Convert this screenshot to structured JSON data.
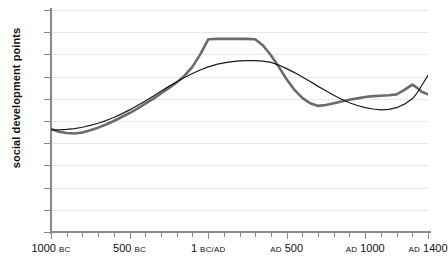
{
  "chart_data": {
    "type": "line",
    "title": "",
    "xlabel": "",
    "ylabel": "social development points",
    "ylim": [
      0,
      50
    ],
    "xlim": [
      -1000,
      1400
    ],
    "grid": true,
    "legend": false,
    "y_ticks": [
      0,
      5,
      10,
      15,
      20,
      25,
      30,
      35,
      40,
      45,
      50
    ],
    "x_major_ticks": [
      {
        "value": -1000,
        "num": "1000",
        "era": "BC"
      },
      {
        "value": -500,
        "num": "500",
        "era": "BC"
      },
      {
        "value": 1,
        "num": "1",
        "era": "BC/AD"
      },
      {
        "value": 500,
        "num": "500",
        "era": "AD",
        "era_first": true
      },
      {
        "value": 1000,
        "num": "1000",
        "era": "AD",
        "era_first": true
      },
      {
        "value": 1400,
        "num": "1400",
        "era": "AD",
        "era_first": true
      }
    ],
    "x_minor_ticks": [
      -900,
      -800,
      -700,
      -600,
      -400,
      -300,
      -200,
      -100,
      100,
      200,
      300,
      400,
      600,
      700,
      800,
      900,
      1100,
      1200,
      1300
    ],
    "series": [
      {
        "name": "thick-gray-series",
        "color": "#6b6b6b",
        "width": 2.6,
        "points": [
          [
            -1000,
            23.2
          ],
          [
            -950,
            22.6
          ],
          [
            -900,
            22.3
          ],
          [
            -850,
            22.2
          ],
          [
            -800,
            22.4
          ],
          [
            -750,
            22.9
          ],
          [
            -700,
            23.5
          ],
          [
            -650,
            24.2
          ],
          [
            -600,
            25.0
          ],
          [
            -550,
            25.9
          ],
          [
            -500,
            26.8
          ],
          [
            -450,
            27.8
          ],
          [
            -400,
            28.9
          ],
          [
            -350,
            30.0
          ],
          [
            -300,
            31.2
          ],
          [
            -250,
            32.4
          ],
          [
            -200,
            33.7
          ],
          [
            -150,
            35.2
          ],
          [
            -100,
            37.2
          ],
          [
            -50,
            40.0
          ],
          [
            1,
            43.4
          ],
          [
            60,
            43.5
          ],
          [
            120,
            43.5
          ],
          [
            180,
            43.5
          ],
          [
            240,
            43.5
          ],
          [
            300,
            43.4
          ],
          [
            350,
            42.0
          ],
          [
            400,
            39.8
          ],
          [
            450,
            37.2
          ],
          [
            500,
            34.4
          ],
          [
            550,
            32.0
          ],
          [
            600,
            30.2
          ],
          [
            650,
            29.0
          ],
          [
            700,
            28.4
          ],
          [
            750,
            28.6
          ],
          [
            800,
            29.0
          ],
          [
            850,
            29.4
          ],
          [
            900,
            29.8
          ],
          [
            950,
            30.1
          ],
          [
            1000,
            30.4
          ],
          [
            1050,
            30.6
          ],
          [
            1100,
            30.7
          ],
          [
            1150,
            30.8
          ],
          [
            1200,
            31.0
          ],
          [
            1250,
            32.0
          ],
          [
            1300,
            33.2
          ],
          [
            1330,
            32.5
          ],
          [
            1360,
            31.6
          ],
          [
            1400,
            31.0
          ]
        ]
      },
      {
        "name": "thin-black-series",
        "color": "#1a1a1a",
        "width": 1.2,
        "points": [
          [
            -1000,
            23.0
          ],
          [
            -950,
            23.0
          ],
          [
            -900,
            23.1
          ],
          [
            -850,
            23.3
          ],
          [
            -800,
            23.6
          ],
          [
            -750,
            24.0
          ],
          [
            -700,
            24.5
          ],
          [
            -650,
            25.1
          ],
          [
            -600,
            25.8
          ],
          [
            -550,
            26.6
          ],
          [
            -500,
            27.5
          ],
          [
            -450,
            28.5
          ],
          [
            -400,
            29.5
          ],
          [
            -350,
            30.6
          ],
          [
            -300,
            31.7
          ],
          [
            -250,
            32.8
          ],
          [
            -200,
            33.8
          ],
          [
            -150,
            34.8
          ],
          [
            -100,
            35.7
          ],
          [
            -50,
            36.5
          ],
          [
            1,
            37.2
          ],
          [
            60,
            37.8
          ],
          [
            120,
            38.2
          ],
          [
            180,
            38.5
          ],
          [
            240,
            38.6
          ],
          [
            300,
            38.6
          ],
          [
            350,
            38.5
          ],
          [
            400,
            38.2
          ],
          [
            450,
            37.6
          ],
          [
            500,
            36.8
          ],
          [
            550,
            35.9
          ],
          [
            600,
            34.9
          ],
          [
            650,
            33.9
          ],
          [
            700,
            32.8
          ],
          [
            750,
            31.8
          ],
          [
            800,
            30.8
          ],
          [
            850,
            29.9
          ],
          [
            900,
            29.1
          ],
          [
            950,
            28.5
          ],
          [
            1000,
            28.0
          ],
          [
            1050,
            27.7
          ],
          [
            1100,
            27.5
          ],
          [
            1150,
            27.6
          ],
          [
            1200,
            28.0
          ],
          [
            1250,
            28.8
          ],
          [
            1300,
            30.0
          ],
          [
            1330,
            31.3
          ],
          [
            1360,
            33.0
          ],
          [
            1400,
            35.3
          ]
        ]
      }
    ]
  }
}
